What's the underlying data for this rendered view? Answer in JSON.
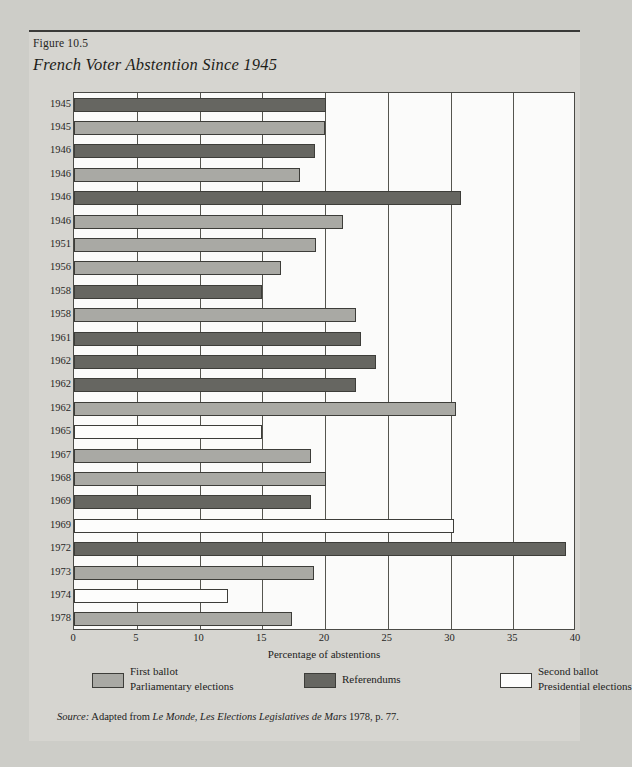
{
  "figure": {
    "number": "Figure 10.5",
    "title": "French Voter Abstention Since 1945"
  },
  "source": {
    "label": "Source:",
    "before": " Adapted from ",
    "italic1": "Le Monde, Les Elections Legislatives de Mars",
    "after": " 1978, p. 77."
  },
  "legend": [
    {
      "swatch": "light",
      "line1": "First ballot",
      "line2": "Parliamentary elections"
    },
    {
      "swatch": "dark",
      "line1": "Referendums",
      "line2": ""
    },
    {
      "swatch": "white",
      "line1": "Second ballot",
      "line2": "Presidential elections"
    }
  ],
  "chart_data": {
    "type": "bar",
    "orientation": "horizontal",
    "title": "French Voter Abstention Since 1945",
    "xlabel": "Percentage of abstentions",
    "ylabel": "",
    "xlim": [
      0,
      40
    ],
    "xticks": [
      0,
      5,
      10,
      15,
      20,
      25,
      30,
      35,
      40
    ],
    "grid": true,
    "legend_position": "bottom",
    "series_colors": {
      "first_ballot_parliamentary": "#a9a9a4",
      "referendums": "#666661",
      "second_ballot_presidential": "#fdfdfc"
    },
    "categories": [
      "1945",
      "1945",
      "1946",
      "1946",
      "1946",
      "1946",
      "1951",
      "1956",
      "1958",
      "1958",
      "1961",
      "1962",
      "1962",
      "1962",
      "1965",
      "1967",
      "1968",
      "1969",
      "1969",
      "1972",
      "1973",
      "1974",
      "1978"
    ],
    "values": [
      20.1,
      20.0,
      19.2,
      18.0,
      30.8,
      21.4,
      19.3,
      16.5,
      15.0,
      22.5,
      22.9,
      24.1,
      22.5,
      30.4,
      15.0,
      18.9,
      20.1,
      18.9,
      30.3,
      39.2,
      19.1,
      12.3,
      17.4
    ],
    "types": [
      "referendums",
      "first_ballot_parliamentary",
      "referendums",
      "first_ballot_parliamentary",
      "referendums",
      "first_ballot_parliamentary",
      "first_ballot_parliamentary",
      "first_ballot_parliamentary",
      "referendums",
      "first_ballot_parliamentary",
      "referendums",
      "referendums",
      "referendums",
      "first_ballot_parliamentary",
      "second_ballot_presidential",
      "first_ballot_parliamentary",
      "first_ballot_parliamentary",
      "referendums",
      "second_ballot_presidential",
      "referendums",
      "first_ballot_parliamentary",
      "second_ballot_presidential",
      "first_ballot_parliamentary"
    ]
  }
}
